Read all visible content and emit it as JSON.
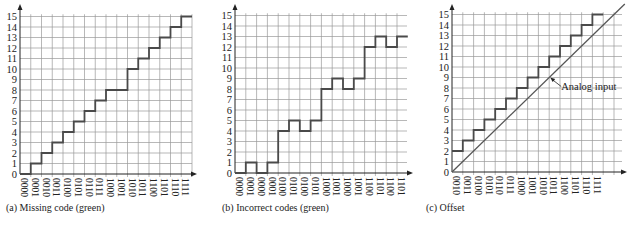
{
  "chart_data": [
    {
      "type": "line",
      "subtype": "step",
      "title": "(a)  Missing code (green)",
      "xlabel": "",
      "ylabel": "",
      "x_tick_labels": [
        "0000",
        "0001",
        "0010",
        "0011",
        "0100",
        "0101",
        "0110",
        "0111",
        "1000",
        "1001",
        "1010",
        "1011",
        "1100",
        "1101",
        "1110",
        "1111"
      ],
      "y_tick_labels": [
        "0",
        "1",
        "2",
        "3",
        "4",
        "5",
        "6",
        "7",
        "8",
        "9",
        "10",
        "11",
        "12",
        "13",
        "14",
        "15"
      ],
      "series": [
        {
          "name": "Output code",
          "values": [
            0,
            1,
            2,
            3,
            4,
            5,
            6,
            7,
            8,
            8,
            10,
            11,
            12,
            13,
            14,
            15
          ]
        }
      ],
      "ylim": [
        0,
        15
      ],
      "grid": true
    },
    {
      "type": "line",
      "subtype": "step",
      "title": "(b)  Incorrect codes (green)",
      "xlabel": "",
      "ylabel": "",
      "x_tick_labels": [
        "0000",
        "0001",
        "0000",
        "0001",
        "0100",
        "0101",
        "0100",
        "0101",
        "1000",
        "1001",
        "1000",
        "1001",
        "1100",
        "1101",
        "1100",
        "1101"
      ],
      "y_tick_labels": [
        "0",
        "1",
        "2",
        "3",
        "4",
        "5",
        "6",
        "7",
        "8",
        "9",
        "10",
        "11",
        "12",
        "13",
        "14",
        "15"
      ],
      "series": [
        {
          "name": "Output code",
          "values": [
            0,
            1,
            0,
            1,
            4,
            5,
            4,
            5,
            8,
            9,
            8,
            9,
            12,
            13,
            12,
            13
          ]
        }
      ],
      "ylim": [
        0,
        15
      ],
      "grid": true
    },
    {
      "type": "line",
      "subtype": "step",
      "title": "(c)  Offset",
      "xlabel": "",
      "ylabel": "",
      "x_tick_labels": [
        "0010",
        "0011",
        "0100",
        "0101",
        "0110",
        "0111",
        "1000",
        "1001",
        "1010",
        "1011",
        "1100",
        "1101",
        "1110",
        "1111"
      ],
      "y_tick_labels": [
        "0",
        "1",
        "2",
        "3",
        "4",
        "5",
        "6",
        "7",
        "8",
        "9",
        "10",
        "11",
        "12",
        "13",
        "14",
        "15"
      ],
      "series": [
        {
          "name": "Output code",
          "values": [
            2,
            3,
            4,
            5,
            6,
            7,
            8,
            9,
            10,
            11,
            12,
            13,
            14,
            15
          ]
        },
        {
          "name": "Analog input",
          "type": "line",
          "x": [
            0,
            16
          ],
          "y": [
            0,
            16
          ]
        }
      ],
      "annotations": [
        {
          "text": "Analog input",
          "at_x": 9,
          "at_y": 9
        }
      ],
      "ylim": [
        0,
        15
      ],
      "grid": true
    }
  ],
  "captions": {
    "a": "(a)  Missing code (green)",
    "b": "(b)  Incorrect codes (green)",
    "c": "(c)  Offset"
  },
  "colors": {
    "grid": "#9a9a9a",
    "axis": "#222222",
    "step": "#4a4a4a",
    "analog": "#555555",
    "text": "#222222"
  }
}
